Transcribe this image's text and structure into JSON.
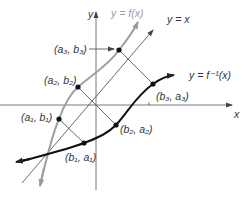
{
  "diagram": {
    "axes": {
      "x_label": "x",
      "y_label": "y"
    },
    "curves": {
      "f": {
        "label": "y = f(x)",
        "color": "#a0a0a0"
      },
      "identity": {
        "label": "y = x",
        "color": "#444444"
      },
      "f_inverse": {
        "label": "y = f⁻¹(x)",
        "color": "#111111"
      }
    },
    "points": [
      {
        "label": "(a₃, b₃)",
        "on": "f"
      },
      {
        "label": "(a₂, b₂)",
        "on": "f"
      },
      {
        "label": "(a₁, b₁)",
        "on": "f"
      },
      {
        "label": "(b₃, a₃)",
        "on": "f_inverse"
      },
      {
        "label": "(b₂, a₂)",
        "on": "f_inverse"
      },
      {
        "label": "(b₁, a₁)",
        "on": "f_inverse"
      }
    ]
  }
}
